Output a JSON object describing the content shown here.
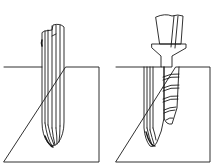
{
  "diagram": {
    "panels": [
      {
        "id": "left",
        "description": "fluted drill inserted into bone block"
      },
      {
        "id": "right",
        "description": "threaded implant with abutment beside fluted drill in bone block"
      }
    ],
    "colors": {
      "line": "#1a1a1a",
      "background": "#ffffff"
    }
  }
}
